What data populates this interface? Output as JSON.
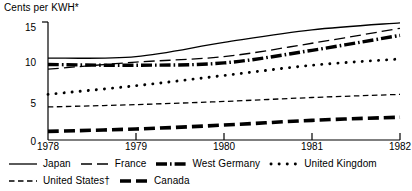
{
  "chart_data": {
    "type": "line",
    "title": "Cents per KWH*",
    "xlabel": "",
    "ylabel": "Cents per KWH*",
    "x": [
      1978,
      1979,
      1980,
      1981,
      1982
    ],
    "categories": [
      "1978",
      "1979",
      "1980",
      "1981",
      "1982"
    ],
    "xlim": [
      1978,
      1982
    ],
    "ylim": [
      0,
      15
    ],
    "yticks": [
      0,
      5,
      10,
      15
    ],
    "ytick_labels": [
      "0",
      "5",
      "10",
      "15"
    ],
    "xticks": [
      1978,
      1979,
      1980,
      1981,
      1982
    ],
    "xtick_labels": [
      "1978",
      "1979",
      "1980",
      "1981",
      "1982"
    ],
    "grid": false,
    "legend_position": "bottom",
    "series": [
      {
        "name": "Japan",
        "style": "solid",
        "values": [
          10.4,
          10.6,
          12.4,
          14.0,
          14.9
        ]
      },
      {
        "name": "France",
        "style": "long-dash",
        "values": [
          9.0,
          9.9,
          10.6,
          12.3,
          14.2
        ]
      },
      {
        "name": "West Germany",
        "style": "thick-dash-dot",
        "values": [
          9.6,
          9.5,
          9.8,
          11.4,
          13.3
        ]
      },
      {
        "name": "United Kingdom",
        "style": "dotted",
        "values": [
          5.8,
          6.9,
          8.2,
          9.5,
          10.3
        ]
      },
      {
        "name": "United States†",
        "style": "short-dash",
        "values": [
          4.2,
          4.5,
          4.9,
          5.4,
          5.8
        ]
      },
      {
        "name": "Canada",
        "style": "thick-dash",
        "values": [
          1.1,
          1.4,
          1.9,
          2.5,
          2.9
        ]
      }
    ]
  },
  "chart": {
    "title": "Cents per KWH*",
    "ytick_labels": [
      "15",
      "10",
      "5",
      "0"
    ],
    "xtick_labels": [
      "1978",
      "1979",
      "1980",
      "1981",
      "1982"
    ]
  },
  "legend": {
    "row1": [
      {
        "label": "Japan",
        "swatch": "solid-line-swatch"
      },
      {
        "label": "France",
        "swatch": "long-dash-swatch"
      },
      {
        "label": "West Germany",
        "swatch": "thick-dash-dot-swatch"
      },
      {
        "label": "United Kingdom",
        "swatch": "dotted-swatch"
      }
    ],
    "row2": [
      {
        "label": "United States†",
        "swatch": "short-dash-swatch"
      },
      {
        "label": "Canada",
        "swatch": "thick-dash-swatch"
      }
    ]
  }
}
